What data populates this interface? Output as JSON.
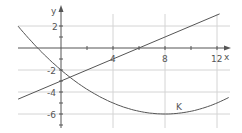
{
  "chart_data": {
    "type": "line",
    "title": "",
    "xlabel": "x",
    "ylabel": "y",
    "xlim": [
      -3.3,
      13
    ],
    "ylim": [
      -7,
      3.1
    ],
    "grid": true,
    "x_ticks": [
      4,
      8,
      12
    ],
    "x_tick_labels": [
      "4",
      "8",
      "12"
    ],
    "y_ticks": [
      2,
      -2,
      -4,
      -6
    ],
    "y_tick_labels": [
      "2",
      "-2",
      "-4",
      "-6"
    ],
    "series": [
      {
        "name": "line",
        "kind": "linear",
        "equation": "y = 0.5x - 3",
        "x": [
          -3.3,
          12.2
        ],
        "y": [
          -4.65,
          3.1
        ]
      },
      {
        "name": "K",
        "kind": "parabola",
        "equation": "y = (x - 8)^2 / 16 - 6",
        "vertex": [
          8,
          -6
        ],
        "x": [
          -3.3,
          -2,
          0,
          2,
          4,
          6,
          8,
          10,
          12,
          12.9
        ],
        "y": [
          1.98,
          0.25,
          -2,
          -3.75,
          -5,
          -5.75,
          -6,
          -5.75,
          -5,
          -4.5
        ]
      }
    ],
    "annotations": [
      {
        "text": "K",
        "x": 9.0,
        "y": -5.2
      }
    ],
    "legend": null
  },
  "labels": {
    "x_axis": "x",
    "y_axis": "y",
    "curve_k": "K",
    "ticks_x": [
      "4",
      "8",
      "12"
    ],
    "ticks_y": [
      "2",
      "-2",
      "-4",
      "-6"
    ]
  },
  "colors": {
    "grid": "#d4d4d4",
    "axis": "#555555",
    "curve": "#555555"
  }
}
